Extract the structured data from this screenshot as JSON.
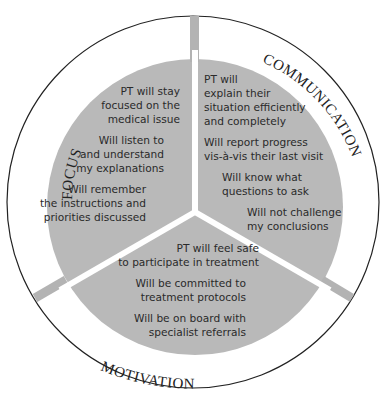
{
  "diagram": {
    "colors": {
      "sector_fill": "#b9b9b9",
      "divider_stub": "#b3b3b3",
      "outline": "#222222",
      "background": "#ffffff"
    },
    "sections": [
      {
        "label": "FOCUS",
        "items": [
          [
            "PT will stay",
            "focused on the",
            "medical issue"
          ],
          [
            "Will listen to",
            "and understand",
            "my explanations"
          ],
          [
            "Will  remember",
            "the instructions and",
            "priorities discussed"
          ]
        ]
      },
      {
        "label": "COMMUNICATION",
        "items": [
          [
            "PT will",
            "explain their",
            "situation efficiently",
            "and completely"
          ],
          [
            "Will report progress",
            "vis-à-vis their last visit"
          ],
          [
            "Will know what",
            "questions to ask"
          ],
          [
            "Will not challenge",
            "my conclusions"
          ]
        ]
      },
      {
        "label": "MOTIVATION",
        "items": [
          [
            "PT will feel safe",
            "to participate in treatment"
          ],
          [
            "Will be committed to",
            "treatment protocols"
          ],
          [
            "Will be on board with",
            "specialist referrals"
          ]
        ]
      }
    ]
  }
}
